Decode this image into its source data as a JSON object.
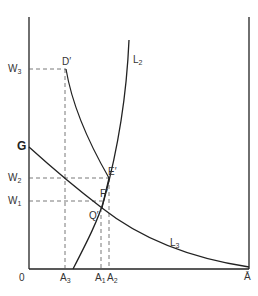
{
  "diagram": {
    "type": "economic-diagram",
    "axes": {
      "origin_label": "0",
      "x_end_label": "Ā"
    },
    "y_labels": {
      "W3": {
        "base": "W",
        "sub": "3"
      },
      "W2": {
        "base": "W",
        "sub": "2"
      },
      "W1": {
        "base": "W",
        "sub": "1"
      },
      "G": "G"
    },
    "x_labels": {
      "A3": {
        "base": "A",
        "sub": "3"
      },
      "A1": {
        "base": "A",
        "sub": "1"
      },
      "A2": {
        "base": "A",
        "sub": "2"
      }
    },
    "points": {
      "D": "D′",
      "E": "E′",
      "F": "F′",
      "Q": "Q′"
    },
    "curves": {
      "L2": {
        "base": "L",
        "sub": "2"
      },
      "L3": {
        "base": "L",
        "sub": "3"
      }
    },
    "colors": {
      "line": "#222222",
      "dashed": "#555555",
      "background": "#ffffff"
    }
  }
}
